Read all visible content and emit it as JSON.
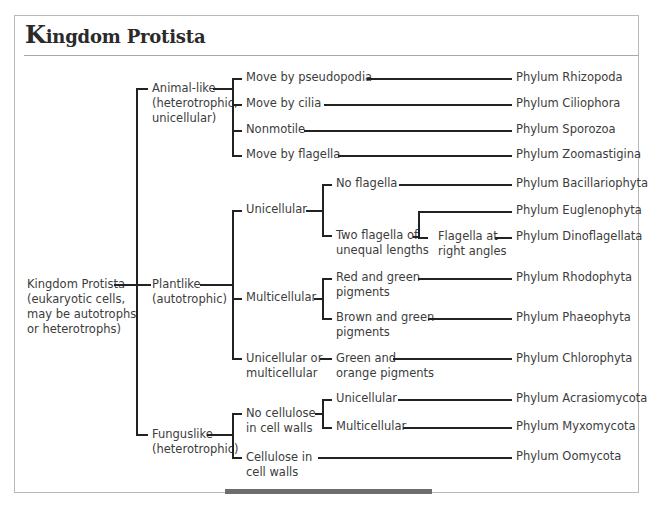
{
  "title": {
    "cap": "K",
    "rest": "ingdom Protista"
  },
  "root": {
    "lines": [
      "Kingdom Protista",
      "(eukaryotic cells,",
      "may be autotrophs",
      "or heterotrophs)"
    ]
  },
  "groups": {
    "animal": {
      "lines": [
        "Animal-like",
        "(heterotrophic,",
        "unicellular)"
      ]
    },
    "plant": {
      "lines": [
        "Plantlike",
        "(autotrophic)"
      ]
    },
    "fungus": {
      "lines": [
        "Funguslike",
        "(heterotrophic)"
      ]
    }
  },
  "animal_branches": [
    {
      "label": "Move by pseudopodia",
      "phylum": "Phylum Rhizopoda"
    },
    {
      "label": "Move by cilia",
      "phylum": "Phylum Ciliophora"
    },
    {
      "label": "Nonmotile",
      "phylum": "Phylum Sporozoa"
    },
    {
      "label": "Move by flagella",
      "phylum": "Phylum Zoomastigina"
    }
  ],
  "plant_branches": {
    "unicellular": {
      "label": "Unicellular",
      "no_flagella": {
        "label": "No flagella",
        "phylum": "Phylum Bacillariophyta"
      },
      "two_flagella": {
        "lines": [
          "Two flagella of",
          "unequal lengths"
        ],
        "phylum": "Phylum Euglenophyta"
      },
      "right_angles": {
        "lines": [
          "Flagella at",
          "right angles"
        ],
        "phylum": "Phylum Dinoflagellata"
      }
    },
    "multicellular": {
      "label": "Multicellular",
      "red_green": {
        "lines": [
          "Red and green",
          "pigments"
        ],
        "phylum": "Phylum Rhodophyta"
      },
      "brown_green": {
        "lines": [
          "Brown and green",
          "pigments"
        ],
        "phylum": "Phylum Phaeophyta"
      }
    },
    "either": {
      "lines": [
        "Unicellular or",
        "multicellular"
      ],
      "green_orange": {
        "lines": [
          "Green and",
          "orange pigments"
        ],
        "phylum": "Phylum Chlorophyta"
      }
    }
  },
  "fungus_branches": {
    "no_cellulose": {
      "lines": [
        "No cellulose",
        "in cell walls"
      ],
      "unicellular": {
        "label": "Unicellular",
        "phylum": "Phylum Acrasiomycota"
      },
      "multicellular": {
        "label": "Multicellular",
        "phylum": "Phylum Myxomycota"
      }
    },
    "cellulose": {
      "lines": [
        "Cellulose in",
        "cell walls"
      ],
      "phylum": "Phylum Oomycota"
    }
  }
}
